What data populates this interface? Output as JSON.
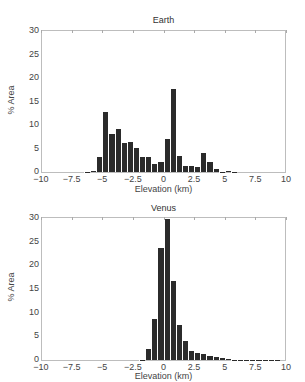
{
  "chart_data": [
    {
      "type": "bar",
      "title": "Earth",
      "xlabel": "Elevation (km)",
      "ylabel": "% Area",
      "xlim": [
        -10,
        10
      ],
      "ylim": [
        0,
        30
      ],
      "xticks": [
        "-10",
        "-7.5",
        "-5",
        "-2.5",
        "0",
        "2.5",
        "5",
        "7.5",
        "10"
      ],
      "yticks": [
        "0",
        "5",
        "10",
        "15",
        "20",
        "25",
        "30"
      ],
      "bin_width": 0.5,
      "grid": false,
      "bin_centers": [
        -6.25,
        -5.75,
        -5.25,
        -4.75,
        -4.25,
        -3.75,
        -3.25,
        -2.75,
        -2.25,
        -1.75,
        -1.25,
        -0.75,
        -0.25,
        0.25,
        0.75,
        1.25,
        1.75,
        2.25,
        2.75,
        3.25,
        3.75,
        4.25,
        4.75,
        5.25,
        5.75
      ],
      "values": [
        0.1,
        0.3,
        3.1,
        12.7,
        8.0,
        9.1,
        6.1,
        6.4,
        5.1,
        3.1,
        3.3,
        1.8,
        2.2,
        7.0,
        17.7,
        3.4,
        1.3,
        1.3,
        1.1,
        4.0,
        2.1,
        0.6,
        0.1,
        0.2,
        0.05
      ]
    },
    {
      "type": "bar",
      "title": "Venus",
      "xlabel": "Elevation (km)",
      "ylabel": "% Area",
      "xlim": [
        -10,
        10
      ],
      "ylim": [
        0,
        30
      ],
      "xticks": [
        "-10",
        "-7.5",
        "-5",
        "-2.5",
        "0",
        "2.5",
        "5",
        "7.5",
        "10"
      ],
      "yticks": [
        "0",
        "5",
        "10",
        "15",
        "20",
        "25",
        "30"
      ],
      "bin_width": 0.5,
      "grid": false,
      "bin_centers": [
        -1.75,
        -1.25,
        -0.75,
        -0.25,
        0.25,
        0.75,
        1.25,
        1.75,
        2.25,
        2.75,
        3.25,
        3.75,
        4.25,
        4.75,
        5.25,
        5.75,
        6.25,
        6.75,
        7.25,
        7.75,
        8.25,
        8.75,
        9.25
      ],
      "values": [
        0.1,
        2.3,
        8.7,
        23.6,
        29.7,
        16.6,
        7.3,
        4.0,
        2.0,
        1.5,
        1.3,
        0.9,
        0.6,
        0.4,
        0.2,
        0.1,
        0.1,
        0.1,
        0.05,
        0.05,
        0.05,
        0.05,
        0.05
      ]
    }
  ]
}
